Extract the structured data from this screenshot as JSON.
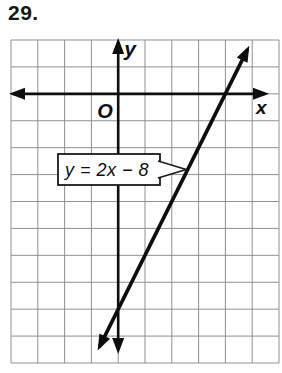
{
  "problem_number": "29.",
  "graph": {
    "y_axis_label": "y",
    "x_axis_label": "x",
    "origin_label": "O",
    "equation_label": "y = 2x − 8"
  },
  "colors": {
    "ink": "#0d0d0d",
    "grid_line": "#909090",
    "paper": "#ffffff"
  },
  "chart_data": {
    "type": "line",
    "title": "",
    "xlabel": "x",
    "ylabel": "y",
    "origin_label": "O",
    "equation": "y = 2x − 8",
    "slope": 2,
    "y_intercept": -8,
    "x_intercept": 4,
    "x_range": [
      -4,
      6
    ],
    "y_range": [
      -10,
      2
    ],
    "grid": true,
    "grid_unit": 1,
    "annotations": [
      {
        "text": "y = 2x − 8",
        "type": "callout-box",
        "points_to": "line"
      }
    ],
    "points": [
      [
        -1,
        -10
      ],
      [
        0,
        -8
      ],
      [
        1,
        -6
      ],
      [
        2,
        -4
      ],
      [
        3,
        -2
      ],
      [
        4,
        0
      ],
      [
        5,
        2
      ]
    ]
  }
}
